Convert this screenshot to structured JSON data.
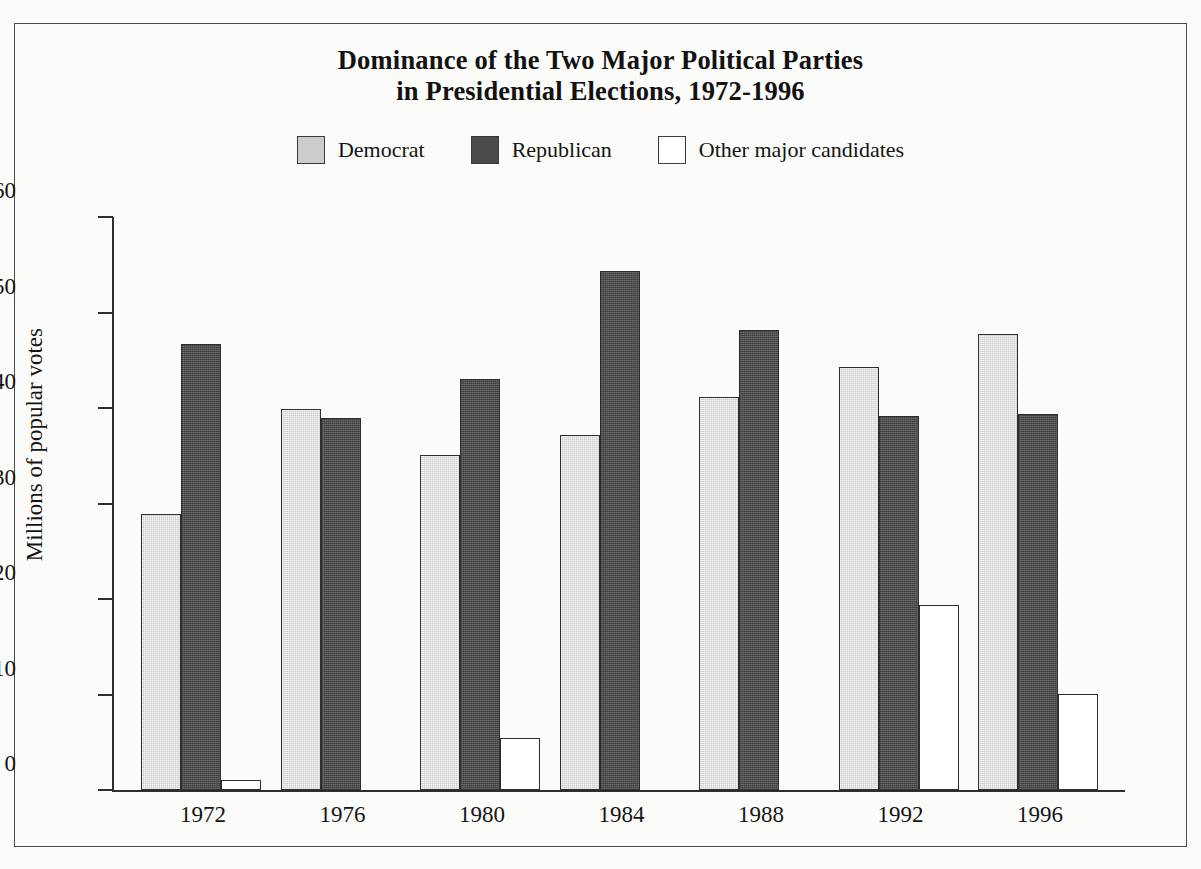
{
  "figure": {
    "title_line1": "Dominance of the Two Major Political Parties",
    "title_line2": "in Presidential Elections, 1972-1996",
    "background_color": "#fbfbf9",
    "frame_color": "#4c4c4c"
  },
  "legend": {
    "position": "top-center",
    "items": [
      {
        "label": "Democrat",
        "color": "#cccccc",
        "swatch": "light-gray-filled"
      },
      {
        "label": "Republican",
        "color": "#4b4b4b",
        "swatch": "dark-gray-filled"
      },
      {
        "label": "Other major candidates",
        "color": "#ffffff",
        "swatch": "white-outline"
      }
    ]
  },
  "chart_data": {
    "type": "bar",
    "title": "Dominance of the Two Major Political Parties in Presidential Elections, 1972-1996",
    "xlabel": "",
    "ylabel": "Millions of popular votes",
    "categories": [
      "1972",
      "1976",
      "1980",
      "1984",
      "1988",
      "1992",
      "1996"
    ],
    "series": [
      {
        "name": "Democrat",
        "color": "#cccccc",
        "values": [
          28.9,
          39.9,
          35.1,
          37.2,
          41.2,
          44.3,
          47.7
        ]
      },
      {
        "name": "Republican",
        "color": "#4b4b4b",
        "values": [
          46.7,
          39.0,
          43.0,
          54.3,
          48.2,
          39.2,
          39.4
        ]
      },
      {
        "name": "Other major candidates",
        "color": "#ffffff",
        "values": [
          1.1,
          0,
          5.4,
          0,
          0,
          19.4,
          10.1
        ]
      }
    ],
    "ylim": [
      0,
      60
    ],
    "yticks": [
      0,
      10,
      20,
      30,
      40,
      50,
      60
    ],
    "ytick_labels": [
      "0",
      "10",
      "20",
      "30",
      "40",
      "50",
      "60"
    ],
    "grid": false,
    "legend_position": "top-center"
  }
}
